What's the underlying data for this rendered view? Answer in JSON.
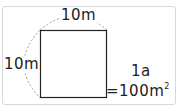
{
  "diagram": {
    "shape": "square",
    "top_side_label": "10m",
    "left_side_label": "10m",
    "unit_label": "1a",
    "equation_prefix": "=100m",
    "equation_superscript": "2",
    "colors": {
      "frame": "#d8d8d8",
      "square_stroke": "#222222",
      "arc_stroke": "#9a9a9a",
      "text": "#222222"
    }
  }
}
